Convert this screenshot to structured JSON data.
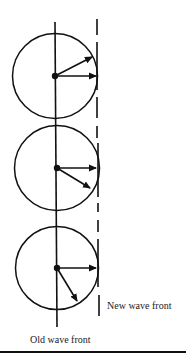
{
  "figure": {
    "labels": {
      "new_wave_front": "New wave front",
      "old_wave_front": "Old wave front"
    },
    "colors": {
      "stroke": "#111111",
      "text": "#222222",
      "background": "#ffffff"
    },
    "old_wave_front": {
      "type": "solid-vertical-line",
      "x": 56,
      "y_start": 22,
      "y_end": 327
    },
    "new_wave_front": {
      "type": "dashed-vertical-line",
      "x": 98,
      "y_start": 19,
      "y_end": 316
    },
    "wavelets": [
      {
        "id": 1,
        "source": {
          "x": 55,
          "y": 76
        },
        "radius": 42,
        "arrows": [
          {
            "to": {
              "x": 92,
              "y": 57
            },
            "direction": "up-right"
          },
          {
            "to": {
              "x": 96,
              "y": 76
            },
            "direction": "right"
          }
        ]
      },
      {
        "id": 2,
        "source": {
          "x": 57,
          "y": 168
        },
        "radius": 42,
        "arrows": [
          {
            "to": {
              "x": 96,
              "y": 168
            },
            "direction": "right"
          },
          {
            "to": {
              "x": 90,
              "y": 188
            },
            "direction": "down-right"
          }
        ]
      },
      {
        "id": 3,
        "source": {
          "x": 57,
          "y": 268
        },
        "radius": 42,
        "arrows": [
          {
            "to": {
              "x": 96,
              "y": 268
            },
            "direction": "right"
          },
          {
            "to": {
              "x": 77,
              "y": 301
            },
            "direction": "down-steep"
          }
        ]
      }
    ]
  }
}
